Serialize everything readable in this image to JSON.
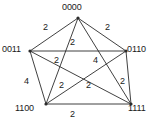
{
  "figure": {
    "background_color": "#ffffff",
    "line_color": "#2b2b2b",
    "text_color": "#1a1a1a"
  },
  "chart_data": {
    "type": "diagram",
    "subtype": "weighted-graph",
    "title": "",
    "layout": "pentagon-with-pentagram-diagonals",
    "grid": false,
    "legend": null,
    "nodes": [
      {
        "id": "n0",
        "label": "0000",
        "x": 78,
        "y": 18,
        "label_x": 62,
        "label_y": 3,
        "label_anchor": "top"
      },
      {
        "id": "n1",
        "label": "0011",
        "x": 30,
        "y": 51,
        "label_x": 2,
        "label_y": 45,
        "label_anchor": "left"
      },
      {
        "id": "n2",
        "label": "0110",
        "x": 126,
        "y": 51,
        "label_x": 127,
        "label_y": 45,
        "label_anchor": "right"
      },
      {
        "id": "n3",
        "label": "1100",
        "x": 46,
        "y": 104,
        "label_x": 15,
        "label_y": 104,
        "label_anchor": "bottom-left"
      },
      {
        "id": "n4",
        "label": "1111",
        "x": 131,
        "y": 104,
        "label_x": 128,
        "label_y": 104,
        "label_anchor": "bottom-right"
      }
    ],
    "edges": [
      {
        "id": "e-0000-0011",
        "source": "n0",
        "target": "n1",
        "weight": "2",
        "kind": "outer",
        "label_x": 43,
        "label_y": 23
      },
      {
        "id": "e-0000-0110",
        "source": "n0",
        "target": "n2",
        "weight": "2",
        "kind": "outer",
        "label_x": 105,
        "label_y": 23
      },
      {
        "id": "e-0011-1100",
        "source": "n1",
        "target": "n3",
        "weight": "4",
        "kind": "outer",
        "label_x": 24,
        "label_y": 77
      },
      {
        "id": "e-0110-1111",
        "source": "n2",
        "target": "n4",
        "weight": "2",
        "kind": "outer",
        "label_x": 120,
        "label_y": 77
      },
      {
        "id": "e-1100-1111",
        "source": "n3",
        "target": "n4",
        "weight": "2",
        "kind": "outer",
        "label_x": 70,
        "label_y": 110
      },
      {
        "id": "e-0011-0110",
        "source": "n1",
        "target": "n2",
        "weight": "2",
        "kind": "diagonal",
        "label_x": 70,
        "label_y": 38
      },
      {
        "id": "e-0000-1100",
        "source": "n0",
        "target": "n3",
        "weight": "2",
        "kind": "diagonal",
        "label_x": 54,
        "label_y": 56
      },
      {
        "id": "e-0000-1111",
        "source": "n0",
        "target": "n4",
        "weight": "4",
        "kind": "diagonal",
        "label_x": 93,
        "label_y": 56
      },
      {
        "id": "e-0011-1111",
        "source": "n1",
        "target": "n4",
        "weight": "2",
        "kind": "diagonal",
        "label_x": 59,
        "label_y": 81
      },
      {
        "id": "e-0110-1100",
        "source": "n2",
        "target": "n3",
        "weight": "2",
        "kind": "diagonal",
        "label_x": 86,
        "label_y": 81
      }
    ]
  }
}
